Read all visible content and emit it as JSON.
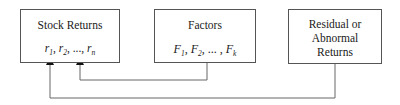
{
  "diagram": {
    "boxes": [
      {
        "id": "stock-returns",
        "title": "Stock Returns",
        "vars": {
          "a": "r",
          "a_sub": "1",
          "b": "r",
          "b_sub": "2",
          "sep": ", ..., ",
          "c": "r",
          "c_sub": "n"
        }
      },
      {
        "id": "factors",
        "title": "Factors",
        "vars": {
          "a": "F",
          "a_sub": "1",
          "b": "F",
          "b_sub": "2",
          "sep": ", ... , ",
          "c": "F",
          "c_sub": "k"
        }
      },
      {
        "id": "residual-returns",
        "title_lines": [
          "Residual or",
          "Abnormal",
          "Returns"
        ]
      }
    ],
    "edges": [
      {
        "from": "factors",
        "to": "stock-returns"
      },
      {
        "from": "residual-returns",
        "to": "stock-returns"
      }
    ]
  }
}
